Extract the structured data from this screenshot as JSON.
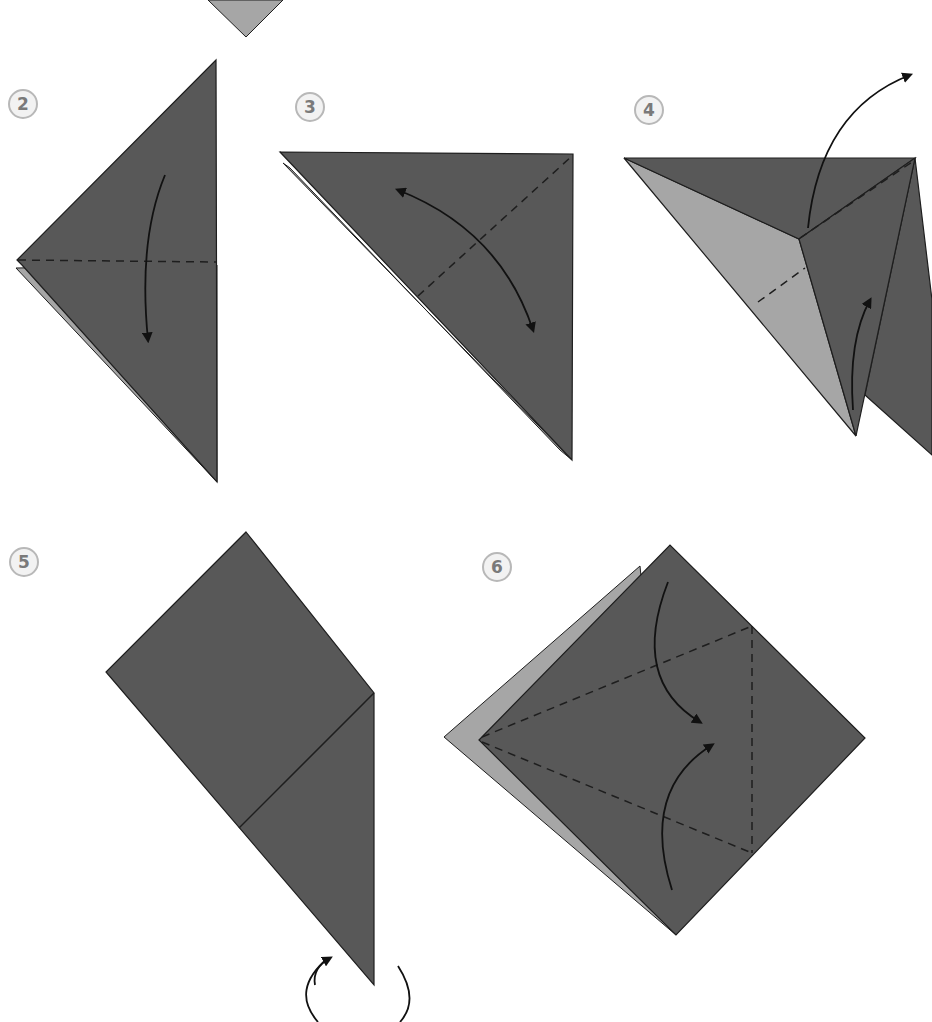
{
  "page": {
    "colors": {
      "paper_dark": "#585858",
      "paper_light": "#a6a6a6",
      "edge": "#1e1e1e",
      "arrow": "#111111",
      "badge_border": "#b8b8b8",
      "badge_fill": "#f2f2f2",
      "badge_text": "#7a7a7a"
    }
  },
  "steps": [
    {
      "number": "2",
      "instruction": "Fold the top half down along the horizontal dashed line",
      "fold": "valley",
      "arrow": "down"
    },
    {
      "number": "3",
      "instruction": "Fold and unfold along the diagonal dashed line",
      "fold": "valley",
      "arrow": "fold-and-unfold"
    },
    {
      "number": "4",
      "instruction": "Squash fold: lift the flap up and open it",
      "fold": "squash",
      "arrow": "up"
    },
    {
      "number": "5",
      "instruction": "Turn the model over",
      "fold": "none",
      "arrow": "turn-over"
    },
    {
      "number": "6",
      "instruction": "Fold both lower edges to the center crease",
      "fold": "valley",
      "arrow": "inward"
    }
  ]
}
